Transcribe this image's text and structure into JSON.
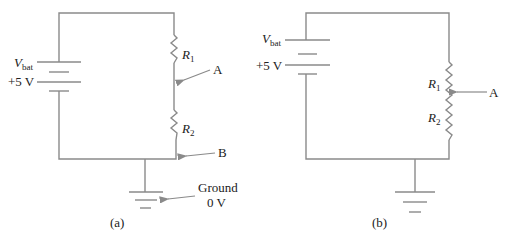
{
  "diagram": {
    "type": "circuit-schematic",
    "panels": [
      {
        "id": "a",
        "caption": "(a)",
        "battery": {
          "name_main": "V",
          "name_sub": "bat",
          "voltage": "+5 V"
        },
        "resistors": [
          {
            "main": "R",
            "sub": "1"
          },
          {
            "main": "R",
            "sub": "2"
          }
        ],
        "annotations": {
          "node_a": "A",
          "node_b": "B",
          "ground_line1": "Ground",
          "ground_line2": "0 V"
        }
      },
      {
        "id": "b",
        "caption": "(b)",
        "battery": {
          "name_main": "V",
          "name_sub": "bat",
          "voltage": "+5 V"
        },
        "resistors": [
          {
            "main": "R",
            "sub": "1"
          },
          {
            "main": "R",
            "sub": "2"
          }
        ],
        "annotations": {
          "wiper": "A"
        }
      }
    ],
    "colors": {
      "wire": "#8a8a8a",
      "text": "#222222",
      "background": "#ffffff"
    }
  }
}
